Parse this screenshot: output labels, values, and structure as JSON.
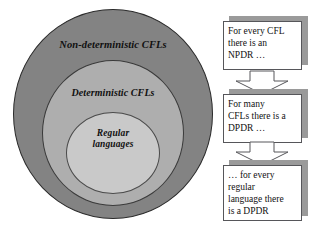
{
  "diagram": {
    "title_alt": "Chomsky language hierarchy with pushdown automata notes",
    "venn": {
      "name": "concentric-language-classes",
      "rings": [
        {
          "id": "non-deterministic-cfls",
          "label": "Non-deterministic CFLs",
          "fill": "#838383",
          "stroke": "#2b2b2b"
        },
        {
          "id": "deterministic-cfls",
          "label": "Deterministic CFLs",
          "fill": "#aeaeae",
          "stroke": "#3a3a3a"
        },
        {
          "id": "regular-languages",
          "label": "Regular\nlanguages",
          "fill": "#c9c9c9",
          "stroke": "#4a4a4a"
        }
      ]
    },
    "flow": {
      "name": "pushdown-automata-flow",
      "arrow_fill": "#ffffff",
      "arrow_stroke": "#56565a",
      "shadow_color": "#9a9a9a",
      "nodes": [
        {
          "id": "node-npdr",
          "text": "For every CFL\nthere is an\nNPDR …"
        },
        {
          "id": "node-dpdr",
          "text": "For many\nCFLs there is a\nDPDR …"
        },
        {
          "id": "node-regular",
          "text": "… for every\nregular\nlanguage there\nis a DPDR"
        }
      ],
      "connectors": [
        {
          "id": "arrow-npdr-to-dpdr",
          "direction": "down"
        },
        {
          "id": "arrow-dpdr-to-regular",
          "direction": "down"
        }
      ]
    }
  }
}
